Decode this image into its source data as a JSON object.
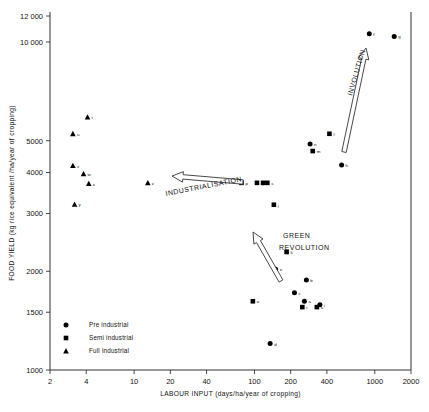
{
  "chart_data": {
    "type": "scatter",
    "title": "",
    "xlabel": "LABOUR INPUT (days/ha/year of cropping)",
    "ylabel": "FOOD YIELD (kg rice equivalent /ha/year of cropping)",
    "xscale": "log",
    "yscale": "log",
    "xlim": [
      2,
      2000
    ],
    "ylim": [
      1000,
      12000
    ],
    "xticks": [
      2,
      4,
      10,
      20,
      40,
      100,
      200,
      400,
      1000,
      2000
    ],
    "xticklabels": [
      "2",
      "4",
      "10",
      "20",
      "40",
      "100",
      "200",
      "400",
      "1000",
      "2000"
    ],
    "yticks": [
      1000,
      1500,
      2000,
      3000,
      4000,
      5000,
      10000,
      12000
    ],
    "yticklabels": [
      "1000",
      "1500",
      "2000",
      "3000",
      "4000",
      "5000",
      "10 000",
      "12 000"
    ],
    "grid": false,
    "legend_position": "lower-left",
    "legend": [
      {
        "label": "Pre industrial",
        "marker": "circle"
      },
      {
        "label": "Semi industrial",
        "marker": "square"
      },
      {
        "label": "Full industrial",
        "marker": "triangle"
      }
    ],
    "series": [
      {
        "name": "Pre industrial",
        "marker": "circle",
        "points": [
          {
            "label": "a",
            "x": 260,
            "y": 1620
          },
          {
            "label": "b",
            "x": 270,
            "y": 1880
          },
          {
            "label": "c",
            "x": 215,
            "y": 1720
          },
          {
            "label": "d",
            "x": 135,
            "y": 1205
          },
          {
            "label": "e",
            "x": 150,
            "y": 2030
          },
          {
            "label": "f",
            "x": 900,
            "y": 10600
          },
          {
            "label": "g",
            "x": 1450,
            "y": 10400
          },
          {
            "label": "h",
            "x": 530,
            "y": 4220
          },
          {
            "label": "i",
            "x": 350,
            "y": 1580
          },
          {
            "label": "n",
            "x": 290,
            "y": 4890
          }
        ]
      },
      {
        "name": "Semi industrial",
        "marker": "square",
        "points": [
          {
            "label": "j",
            "x": 145,
            "y": 3190
          },
          {
            "label": "k",
            "x": 185,
            "y": 2290
          },
          {
            "label": "l",
            "x": 420,
            "y": 5250
          },
          {
            "label": "m",
            "x": 305,
            "y": 4650
          },
          {
            "label": "o",
            "x": 97,
            "y": 1620
          },
          {
            "label": "p",
            "x": 78,
            "y": 3720
          },
          {
            "label": "q",
            "x": 105,
            "y": 3720
          },
          {
            "label": "r",
            "x": 118,
            "y": 3720
          },
          {
            "label": "s",
            "x": 128,
            "y": 3720
          },
          {
            "label": "t",
            "x": 250,
            "y": 1555
          },
          {
            "label": "u",
            "x": 330,
            "y": 1555
          }
        ]
      },
      {
        "name": "Full industrial",
        "marker": "triangle",
        "points": [
          {
            "label": "t",
            "x": 4.1,
            "y": 5900
          },
          {
            "label": "u",
            "x": 3.1,
            "y": 5250
          },
          {
            "label": "v",
            "x": 3.1,
            "y": 4200
          },
          {
            "label": "w",
            "x": 3.8,
            "y": 3960
          },
          {
            "label": "x",
            "x": 4.2,
            "y": 3700
          },
          {
            "label": "y",
            "x": 3.2,
            "y": 3200
          },
          {
            "label": "z",
            "x": 13,
            "y": 3720
          }
        ]
      }
    ],
    "annotations": [
      {
        "label": "INVOLUTION",
        "arrow": "up",
        "angle": -73
      },
      {
        "label": "INDUSTRIALISATION",
        "arrow": "left",
        "angle": -11
      },
      {
        "label": "GREEN",
        "arrow": "up-left",
        "angle": -59
      },
      {
        "label": "REVOLUTION",
        "arrow": "none",
        "angle": 0
      }
    ]
  }
}
